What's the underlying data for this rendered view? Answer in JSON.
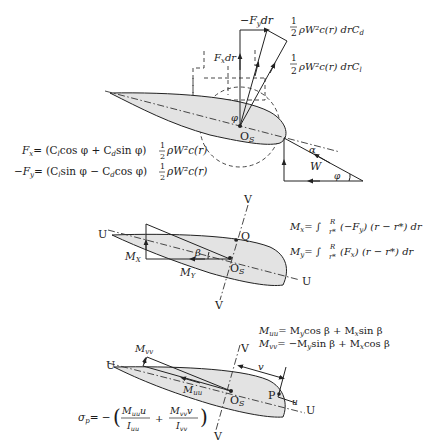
{
  "figure": {
    "panel1": {
      "force_labels": {
        "fy": "−F",
        "fy_sub": "y",
        "fy_tail": "dr",
        "fx": "F",
        "fx_sub": "x",
        "fx_tail": "dr",
        "drag_num": "1",
        "drag_den": "2",
        "drag_text": "ρW²c(r) drC",
        "drag_sub": "d",
        "lift_num": "1",
        "lift_den": "2",
        "lift_text": "ρW²c(r) drC",
        "lift_sub": "l"
      },
      "angles": {
        "phi": "φ",
        "phi2": "φ",
        "alpha": "α"
      },
      "velocity_label": "W",
      "origin_label": "O",
      "origin_sub": "S",
      "equations": {
        "fx_lhs": "F",
        "fx_lhs_sub": "x",
        "fx_rhs": "= (C",
        "fx_rhs2": "cos φ + C",
        "fx_rhs3": "sin φ)",
        "fx_frac_num": "1",
        "fx_frac_den": "2",
        "fx_tail": "ρW²c(r)",
        "fy_lhs": "−F",
        "fy_lhs_sub": "y",
        "fy_rhs": "= (C",
        "fy_rhs2": "sin φ − C",
        "fy_rhs3": "cos φ)",
        "fy_frac_num": "1",
        "fy_frac_den": "2",
        "fy_tail": "ρW²c(r)",
        "sub_l": "l",
        "sub_d": "d"
      }
    },
    "panel2": {
      "axis_u_left": "U",
      "axis_u_right": "U",
      "axis_v_top": "V",
      "axis_v_bottom": "V",
      "point_q": "Q",
      "origin_label": "O",
      "origin_sub": "S",
      "beta": "β",
      "mx": "M",
      "mx_sub": "X",
      "my": "M",
      "my_sub": "Y",
      "eq_mx_lhs": "M",
      "eq_mx_sub": "x",
      "eq_mx_rhs": "= ∫",
      "eq_mx_body": "(−F",
      "eq_mx_body_sub": "y",
      "eq_mx_tail": ") (r − r*) dr",
      "eq_my_lhs": "M",
      "eq_my_sub": "y",
      "eq_my_rhs": "= ∫",
      "eq_my_body": "(F",
      "eq_my_body_sub": "x",
      "eq_my_tail": ") (r − r*) dr",
      "int_upper": "R",
      "int_lower": "r*"
    },
    "panel3": {
      "axis_u_left": "U",
      "axis_u_right": "U",
      "axis_v_top": "V",
      "axis_v_bottom": "V",
      "point_p": "P",
      "origin_label": "O",
      "origin_sub": "S",
      "dist_v": "v",
      "dist_u": "u",
      "muu": "M",
      "muu_sub": "uu",
      "mvv": "M",
      "mvv_sub": "vv",
      "eq_muu": "M",
      "eq_muu_sub": "uu",
      "eq_muu_rhs": "= M",
      "eq_muu_rhs_sub": "y",
      "eq_muu_rhs2": "cos β + M",
      "eq_muu_rhs2_sub": "x",
      "eq_muu_rhs3": "sin β",
      "eq_mvv": "M",
      "eq_mvv_sub": "vv",
      "eq_mvv_rhs": "= −M",
      "eq_mvv_rhs_sub": "y",
      "eq_mvv_rhs2": "sin β + M",
      "eq_mvv_rhs2_sub": "x",
      "eq_mvv_rhs3": "cos β",
      "sigma_lhs": "σ",
      "sigma_sub": "p",
      "sigma_eq": "= −",
      "frac1_num": "M",
      "frac1_num_sub": "uu",
      "frac1_num_tail": "u",
      "frac1_den": "I",
      "frac1_den_sub": "uu",
      "plus": "+",
      "frac2_num": "M",
      "frac2_num_sub": "vv",
      "frac2_num_tail": "v",
      "frac2_den": "I",
      "frac2_den_sub": "vv"
    }
  }
}
